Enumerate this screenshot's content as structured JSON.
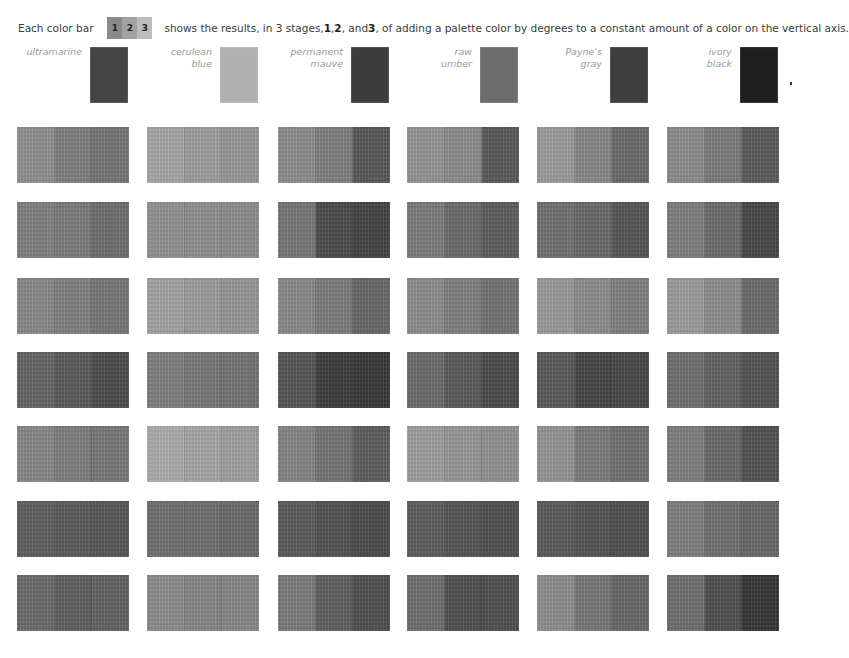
{
  "intro": {
    "prefix": "Each color bar",
    "key_stages": [
      "1",
      "2",
      "3"
    ],
    "key_colors": [
      "#8a8a8a",
      "#a2a2a2",
      "#bcbcbc"
    ],
    "text_a": "shows the results, in 3 stages, ",
    "s1": "1",
    "sep1": ", ",
    "s2": "2",
    "sep2": ", and ",
    "s3": "3",
    "text_b": ", of adding a palette color by degrees to a constant amount of a color on the vertical axis."
  },
  "palette": [
    {
      "line1": "ultramarine",
      "line2": "",
      "color": "#444444"
    },
    {
      "line1": "cerulean",
      "line2": "blue",
      "color": "#b0b0b0"
    },
    {
      "line1": "permanent",
      "line2": "mauve",
      "color": "#3c3c3c"
    },
    {
      "line1": "raw",
      "line2": "umber",
      "color": "#6c6c6c"
    },
    {
      "line1": "Payne's",
      "line2": "gray",
      "color": "#3e3e3e"
    },
    {
      "line1": "ivory",
      "line2": "black",
      "color": "#1e1e1e"
    }
  ],
  "grid": [
    [
      [
        "#8e8e8e",
        "#7e7e7e",
        "#747474"
      ],
      [
        "#a4a4a4",
        "#9c9c9c",
        "#969696"
      ],
      [
        "#8c8c8c",
        "#7e7e7e",
        "#575757"
      ],
      [
        "#939393",
        "#8a8a8a",
        "#595959"
      ],
      [
        "#9a9a9a",
        "#868686",
        "#6a6a6a"
      ],
      [
        "#8a8a8a",
        "#7a7a7a",
        "#5a5a5a"
      ]
    ],
    [
      [
        "#7f7f7f",
        "#7a7a7a",
        "#6c6c6c"
      ],
      [
        "#909090",
        "#8e8e8e",
        "#8c8c8c"
      ],
      [
        "#757575",
        "#4a4a4a",
        "#444444"
      ],
      [
        "#7a7a7a",
        "#6a6a6a",
        "#5c5c5c"
      ],
      [
        "#6f6f6f",
        "#686868",
        "#555555"
      ],
      [
        "#7c7c7c",
        "#6a6a6a",
        "#474747"
      ]
    ],
    [
      [
        "#878787",
        "#7f7f7f",
        "#757575"
      ],
      [
        "#a0a0a0",
        "#9a9a9a",
        "#959595"
      ],
      [
        "#888888",
        "#7a7a7a",
        "#666666"
      ],
      [
        "#8a8a8a",
        "#7f7f7f",
        "#727272"
      ],
      [
        "#989898",
        "#8a8a8a",
        "#7e7e7e"
      ],
      [
        "#9a9a9a",
        "#8c8c8c",
        "#6a6a6a"
      ]
    ],
    [
      [
        "#646464",
        "#5a5a5a",
        "#4a4a4a"
      ],
      [
        "#7c7c7c",
        "#767676",
        "#727272"
      ],
      [
        "#555555",
        "#3c3c3c",
        "#383838"
      ],
      [
        "#6a6a6a",
        "#5a5a5a",
        "#4a4a4a"
      ],
      [
        "#585858",
        "#464646",
        "#484848"
      ],
      [
        "#6c6c6c",
        "#626262",
        "#525252"
      ]
    ],
    [
      [
        "#858585",
        "#7c7c7c",
        "#767676"
      ],
      [
        "#aaaaaa",
        "#a4a4a4",
        "#9e9e9e"
      ],
      [
        "#838383",
        "#747474",
        "#5c5c5c"
      ],
      [
        "#9d9d9d",
        "#969696",
        "#8f8f8f"
      ],
      [
        "#939393",
        "#7a7a7a",
        "#6e6e6e"
      ],
      [
        "#7c7c7c",
        "#686868",
        "#505050"
      ]
    ],
    [
      [
        "#5e5e5e",
        "#5a5a5a",
        "#565656"
      ],
      [
        "#6e6e6e",
        "#6c6c6c",
        "#6a6a6a"
      ],
      [
        "#5a5a5a",
        "#505050",
        "#4a4a4a"
      ],
      [
        "#5c5c5c",
        "#545454",
        "#4e4e4e"
      ],
      [
        "#5a5a5a",
        "#525252",
        "#4e4e4e"
      ],
      [
        "#7c7c7c",
        "#6e6e6e",
        "#686868"
      ]
    ],
    [
      [
        "#6a6a6a",
        "#5e5e5e",
        "#626262"
      ],
      [
        "#8a8a8a",
        "#848484",
        "#858585"
      ],
      [
        "#7a7a7a",
        "#5e5e5e",
        "#4e4e4e"
      ],
      [
        "#6c6c6c",
        "#4e4e4e",
        "#4e4e4e"
      ],
      [
        "#8c8c8c",
        "#767676",
        "#666666"
      ],
      [
        "#6c6c6c",
        "#4e4e4e",
        "#363636"
      ]
    ]
  ]
}
